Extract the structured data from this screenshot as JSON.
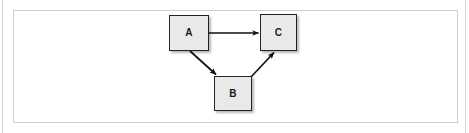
{
  "figure": {
    "kind": "directed-graph",
    "background_color": "#ffffff",
    "frame": {
      "outer_border_color": "#d4d4d4",
      "inner_border_color": "#cfcfcf"
    },
    "node_style": {
      "fill_color": "#e9e9e9",
      "border_color": "#242424",
      "label_color": "#1a1a1a",
      "shadow_color": "rgba(0,0,0,0.28)"
    },
    "edge_style": {
      "line_color": "#111111",
      "arrowhead_color": "#111111"
    }
  },
  "nodes": [
    {
      "id": "A",
      "label": "A",
      "x": 169,
      "y": 15,
      "width": 40,
      "height": 36
    },
    {
      "id": "B",
      "label": "B",
      "x": 214,
      "y": 76,
      "width": 38,
      "height": 35
    },
    {
      "id": "C",
      "label": "C",
      "x": 260,
      "y": 14,
      "width": 37,
      "height": 37
    }
  ],
  "edges": [
    {
      "id": "A-C",
      "from": "A",
      "to": "C",
      "label": "",
      "direction": "right"
    },
    {
      "id": "A-B",
      "from": "A",
      "to": "B",
      "label": "",
      "direction": "down-right"
    },
    {
      "id": "B-C",
      "from": "B",
      "to": "C",
      "label": "",
      "direction": "up-right"
    }
  ]
}
